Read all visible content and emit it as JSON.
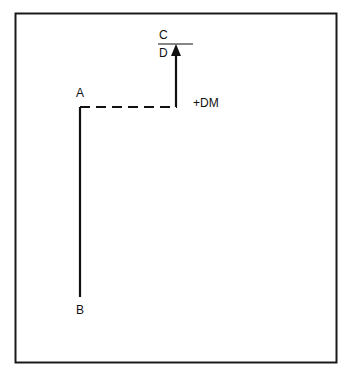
{
  "diagram": {
    "type": "vector-path",
    "frame": {
      "stroke": "#1a1a1a"
    },
    "labels": {
      "A": "A",
      "B": "B",
      "C": "C",
      "D": "D",
      "displacement": "+DM"
    },
    "segments": [
      {
        "from": "A",
        "to": "B",
        "style": "solid"
      },
      {
        "from": "A",
        "to": "corner",
        "style": "dashed"
      },
      {
        "from": "corner",
        "to": "D",
        "style": "solid-arrow",
        "label": "+DM"
      },
      {
        "name": "C-D divider",
        "style": "solid"
      }
    ],
    "colors": {
      "line": "#111111",
      "background": "#ffffff"
    }
  }
}
